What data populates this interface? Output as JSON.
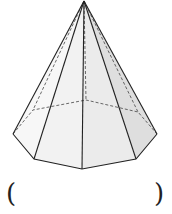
{
  "figure": {
    "type": "octagonal-pyramid",
    "apex": [
      84,
      1
    ],
    "base_visible": [
      [
        13,
        134
      ],
      [
        34,
        159
      ],
      [
        82,
        169
      ],
      [
        136,
        159
      ],
      [
        157,
        134
      ]
    ],
    "base_hidden": [
      [
        33,
        110
      ],
      [
        86,
        100
      ],
      [
        138,
        112
      ]
    ],
    "colors": {
      "edge": "#222222",
      "face_light": "#f4f4f4",
      "face_mid": "#ebebeb",
      "face_dark": "#dcdcdc"
    }
  },
  "answer": {
    "left_paren": "(",
    "right_paren": ")"
  }
}
